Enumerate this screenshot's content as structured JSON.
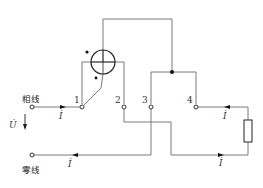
{
  "diagram": {
    "type": "wattmeter-wiring-circuit",
    "labels": {
      "phase_line": "相线",
      "neutral_line": "零线",
      "voltage": "U̇",
      "current_phase": "İ",
      "current_neutral": "İ",
      "current_load_top": "İ",
      "current_load_bottom": "İ"
    },
    "terminals": [
      {
        "id": "1",
        "label": "1"
      },
      {
        "id": "2",
        "label": "2"
      },
      {
        "id": "3",
        "label": "3"
      },
      {
        "id": "4",
        "label": "4"
      }
    ],
    "components": {
      "meter": "wattmeter-coil-circle",
      "load": "resistor",
      "polarity_marks": [
        "•",
        "*"
      ]
    },
    "colors": {
      "wire": "#7a7a7a",
      "symbol": "#222222",
      "background": "#ffffff"
    }
  }
}
